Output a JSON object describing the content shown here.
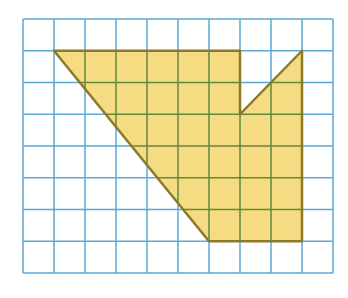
{
  "figure": {
    "grid": {
      "columns": 10,
      "rows": 8,
      "origin_px": [
        23,
        19
      ],
      "cell_w_px": 31,
      "cell_h_px": 31.75,
      "line_color": "#5aa9d8",
      "line_width": 1.5
    },
    "shape": {
      "vertices_grid": [
        [
          1,
          1
        ],
        [
          7,
          1
        ],
        [
          7,
          3
        ],
        [
          9,
          1
        ],
        [
          9,
          7
        ],
        [
          6,
          7
        ]
      ],
      "fill_color": "#f5dc82",
      "stroke_color": "#8a7a2a",
      "inner_grid_color": "#5f8a3a",
      "stroke_width": 2.5
    }
  }
}
